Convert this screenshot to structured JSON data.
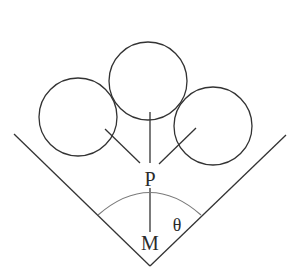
{
  "diagram": {
    "labels": {
      "P": "P",
      "M": "M",
      "theta": "θ"
    },
    "colors": {
      "stroke": "#333333",
      "arc": "#7a7a7a",
      "text": "#2b2b2b",
      "background": "#ffffff"
    },
    "elements": {
      "groove": "V-shaped groove",
      "balls": [
        "left ball",
        "top ball",
        "right ball"
      ],
      "angle": "angle θ between groove wall and vertical PM"
    }
  }
}
